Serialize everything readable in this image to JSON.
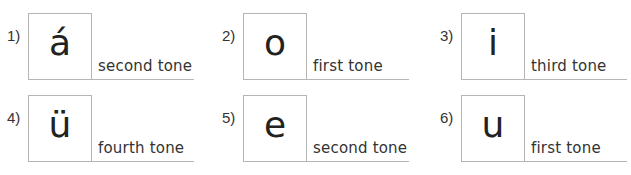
{
  "items": [
    {
      "number": "1)",
      "letter": "á",
      "tone": "second tone"
    },
    {
      "number": "2)",
      "letter": "o",
      "tone": "first tone"
    },
    {
      "number": "3)",
      "letter": "i",
      "tone": "third tone"
    },
    {
      "number": "4)",
      "letter": "ü",
      "tone": "fourth tone"
    },
    {
      "number": "5)",
      "letter": "e",
      "tone": "second tone"
    },
    {
      "number": "6)",
      "letter": "u",
      "tone": "first tone"
    }
  ]
}
